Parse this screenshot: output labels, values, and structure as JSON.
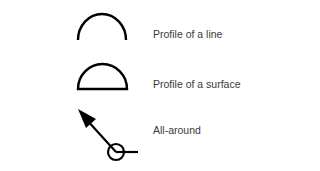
{
  "symbols": [
    {
      "name": "profile-of-a-line",
      "label": "Profile of a line",
      "icon": "arc"
    },
    {
      "name": "profile-of-a-surface",
      "label": "Profile of a surface",
      "icon": "closed-semicircle"
    },
    {
      "name": "all-around",
      "label": "All-around",
      "icon": "leader-arrow-with-circle"
    }
  ]
}
